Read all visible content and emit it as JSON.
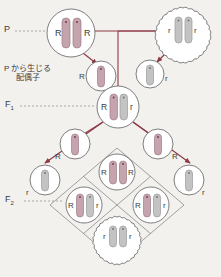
{
  "diagram": {
    "title_visible": false,
    "background_color": "#f3f1ee",
    "labels": {
      "p_generation": "P",
      "p_gametes_line1": "P から生じる",
      "p_gametes_line2": "配偶子",
      "f1_generation": "F",
      "f1_subscript": "1",
      "f2_generation": "F",
      "f2_subscript": "2"
    },
    "colors": {
      "dominant_chromosome": "#c6a4ae",
      "recessive_chromosome": "#c3c3c3",
      "arrow": "#8e3a46",
      "line": "#8e3a46",
      "outline": "#6f6f6f",
      "text": "#3b3b3b",
      "dotted_leader": "#8a8a8a",
      "punnett_border": "#8a8a8a"
    },
    "allele_symbols": {
      "dominant": "R",
      "recessive": "r"
    },
    "cells": [
      {
        "id": "parent-male",
        "role": "P parent",
        "genotype": "RR",
        "alleles": [
          "R",
          "R"
        ],
        "chromosomes": [
          "dominant",
          "dominant"
        ],
        "shape": "circle",
        "x": 71,
        "y": 33,
        "r": 24
      },
      {
        "id": "parent-female",
        "role": "P parent",
        "genotype": "rr",
        "alleles": [
          "r",
          "r"
        ],
        "chromosomes": [
          "recessive",
          "recessive"
        ],
        "shape": "scallop",
        "x": 183,
        "y": 30,
        "r": 22
      },
      {
        "id": "gamete-p-left",
        "role": "P gamete",
        "genotype": "R",
        "alleles": [
          "R"
        ],
        "chromosomes": [
          "dominant"
        ],
        "shape": "circle",
        "x": 101,
        "y": 76,
        "r": 15
      },
      {
        "id": "gamete-p-right",
        "role": "P gamete",
        "genotype": "r",
        "alleles": [
          "r"
        ],
        "chromosomes": [
          "recessive"
        ],
        "shape": "circle",
        "x": 150,
        "y": 74,
        "r": 14
      },
      {
        "id": "f1-offspring",
        "role": "F1",
        "genotype": "Rr",
        "alleles": [
          "R",
          "r"
        ],
        "chromosomes": [
          "dominant",
          "recessive"
        ],
        "shape": "circle",
        "x": 118,
        "y": 107,
        "r": 21
      },
      {
        "id": "gamete-f1-a",
        "role": "F1 gamete",
        "genotype": "R",
        "alleles": [
          "R"
        ],
        "chromosomes": [
          "dominant"
        ],
        "shape": "circle",
        "x": 75,
        "y": 144,
        "r": 15
      },
      {
        "id": "gamete-f1-b",
        "role": "F1 gamete",
        "genotype": "R",
        "alleles": [
          "R"
        ],
        "chromosomes": [
          "dominant"
        ],
        "shape": "circle",
        "x": 158,
        "y": 144,
        "r": 15
      },
      {
        "id": "gamete-f1-c",
        "role": "F1 gamete",
        "genotype": "r",
        "alleles": [
          "r"
        ],
        "chromosomes": [
          "recessive"
        ],
        "shape": "circle",
        "x": 45,
        "y": 180,
        "r": 15
      },
      {
        "id": "gamete-f1-d",
        "role": "F1 gamete",
        "genotype": "r",
        "alleles": [
          "r"
        ],
        "chromosomes": [
          "recessive"
        ],
        "shape": "circle",
        "x": 189,
        "y": 180,
        "r": 15
      },
      {
        "id": "f2-top",
        "role": "F2",
        "genotype": "RR",
        "alleles": [
          "R",
          "R"
        ],
        "chromosomes": [
          "dominant",
          "dominant"
        ],
        "shape": "circle",
        "x": 117,
        "y": 172,
        "r": 19
      },
      {
        "id": "f2-left",
        "role": "F2",
        "genotype": "Rr",
        "alleles": [
          "R",
          "r"
        ],
        "chromosomes": [
          "dominant",
          "recessive"
        ],
        "shape": "circle",
        "x": 84,
        "y": 205,
        "r": 19
      },
      {
        "id": "f2-right",
        "role": "F2",
        "genotype": "Rr",
        "alleles": [
          "R",
          "r"
        ],
        "chromosomes": [
          "dominant",
          "recessive"
        ],
        "shape": "circle",
        "x": 151,
        "y": 205,
        "r": 19
      },
      {
        "id": "f2-bottom",
        "role": "F2",
        "genotype": "rr",
        "alleles": [
          "r",
          "r"
        ],
        "chromosomes": [
          "recessive",
          "recessive"
        ],
        "shape": "scallop",
        "x": 117,
        "y": 236,
        "r": 19
      }
    ],
    "f2_ratio": "3:1"
  }
}
